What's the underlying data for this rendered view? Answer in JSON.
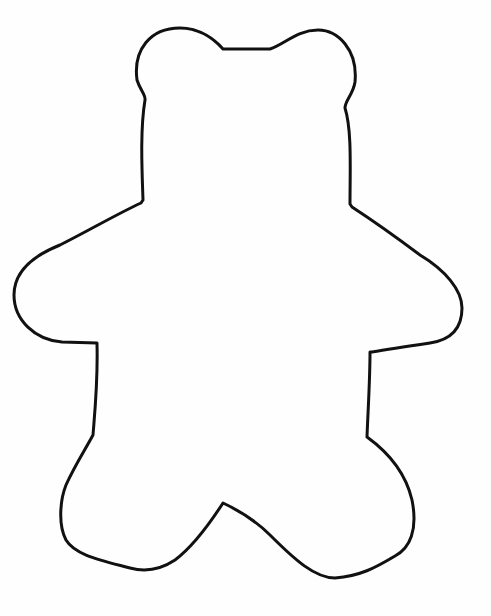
{
  "image": {
    "subject": "teddy bear outline",
    "style": "black line drawing on white background",
    "colors": {
      "background": "#fefefe",
      "stroke": "#111111"
    },
    "stroke_width": 3
  }
}
